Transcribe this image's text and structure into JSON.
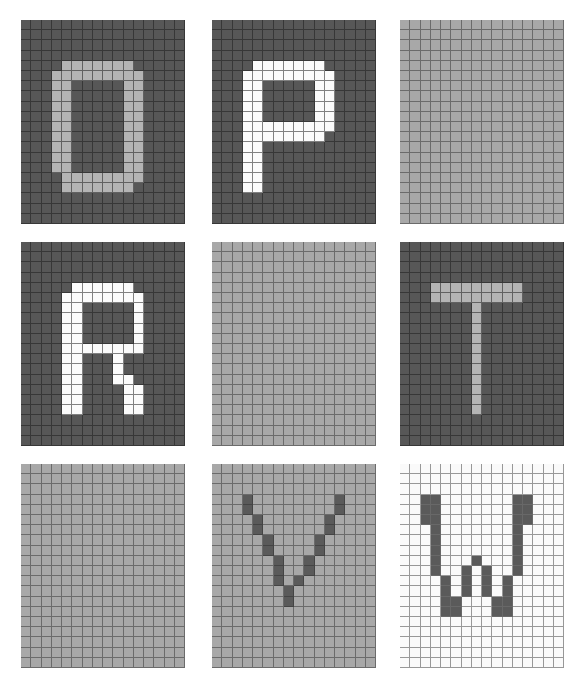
{
  "figure": {
    "type": "pixel-art-letter-grid-montage",
    "rows": 3,
    "cols": 3,
    "background_color": "#ffffff",
    "panel_grid_cols": 16,
    "panel_grid_rows": 20
  },
  "palette": {
    "dark_gray_background": "#575757",
    "light_gray_background": "#a8a8a8",
    "white_background": "#fafafa",
    "light_gray_foreground": "#b4b4b4",
    "white_foreground": "#fbfbfb",
    "dark_gray_foreground": "#5a5a5a",
    "gridline_dark": "#1e1e1e",
    "gridline_light": "#6e6e6e"
  },
  "panels": [
    {
      "index": 0,
      "position": "row1-col1",
      "letter": "O",
      "background_color": "#575757",
      "foreground_color": "#b4b4b4",
      "gridline_style": "lines-dark",
      "x": 21,
      "y": 20,
      "w": 164,
      "h": 204,
      "cols": 16,
      "rows": 20,
      "filled_cells": [
        [
          4,
          4
        ],
        [
          4,
          5
        ],
        [
          4,
          6
        ],
        [
          4,
          7
        ],
        [
          4,
          8
        ],
        [
          4,
          9
        ],
        [
          4,
          10
        ],
        [
          5,
          3
        ],
        [
          5,
          4
        ],
        [
          5,
          5
        ],
        [
          5,
          6
        ],
        [
          5,
          7
        ],
        [
          5,
          8
        ],
        [
          5,
          9
        ],
        [
          5,
          10
        ],
        [
          5,
          11
        ],
        [
          6,
          3
        ],
        [
          6,
          4
        ],
        [
          6,
          10
        ],
        [
          6,
          11
        ],
        [
          7,
          3
        ],
        [
          7,
          4
        ],
        [
          7,
          10
        ],
        [
          7,
          11
        ],
        [
          8,
          3
        ],
        [
          8,
          4
        ],
        [
          8,
          10
        ],
        [
          8,
          11
        ],
        [
          9,
          3
        ],
        [
          9,
          4
        ],
        [
          9,
          10
        ],
        [
          9,
          11
        ],
        [
          10,
          3
        ],
        [
          10,
          4
        ],
        [
          10,
          10
        ],
        [
          10,
          11
        ],
        [
          11,
          3
        ],
        [
          11,
          4
        ],
        [
          11,
          10
        ],
        [
          11,
          11
        ],
        [
          12,
          3
        ],
        [
          12,
          4
        ],
        [
          12,
          10
        ],
        [
          12,
          11
        ],
        [
          13,
          3
        ],
        [
          13,
          4
        ],
        [
          13,
          10
        ],
        [
          13,
          11
        ],
        [
          14,
          3
        ],
        [
          14,
          4
        ],
        [
          14,
          10
        ],
        [
          14,
          11
        ],
        [
          15,
          4
        ],
        [
          15,
          5
        ],
        [
          15,
          6
        ],
        [
          15,
          7
        ],
        [
          15,
          8
        ],
        [
          15,
          9
        ],
        [
          15,
          10
        ],
        [
          15,
          11
        ],
        [
          16,
          4
        ],
        [
          16,
          5
        ],
        [
          16,
          6
        ],
        [
          16,
          7
        ],
        [
          16,
          8
        ],
        [
          16,
          9
        ],
        [
          16,
          10
        ]
      ]
    },
    {
      "index": 1,
      "position": "row1-col2",
      "letter": "P",
      "background_color": "#575757",
      "foreground_color": "#fbfbfb",
      "gridline_style": "lines-dark",
      "x": 212,
      "y": 20,
      "w": 164,
      "h": 204,
      "cols": 16,
      "rows": 20,
      "filled_cells": [
        [
          4,
          4
        ],
        [
          4,
          5
        ],
        [
          4,
          6
        ],
        [
          4,
          7
        ],
        [
          4,
          8
        ],
        [
          4,
          9
        ],
        [
          4,
          10
        ],
        [
          5,
          3
        ],
        [
          5,
          4
        ],
        [
          5,
          5
        ],
        [
          5,
          6
        ],
        [
          5,
          7
        ],
        [
          5,
          8
        ],
        [
          5,
          9
        ],
        [
          5,
          10
        ],
        [
          5,
          11
        ],
        [
          6,
          3
        ],
        [
          6,
          4
        ],
        [
          6,
          10
        ],
        [
          6,
          11
        ],
        [
          7,
          3
        ],
        [
          7,
          4
        ],
        [
          7,
          10
        ],
        [
          7,
          11
        ],
        [
          8,
          3
        ],
        [
          8,
          4
        ],
        [
          8,
          10
        ],
        [
          8,
          11
        ],
        [
          9,
          3
        ],
        [
          9,
          4
        ],
        [
          9,
          10
        ],
        [
          9,
          11
        ],
        [
          10,
          3
        ],
        [
          10,
          4
        ],
        [
          10,
          5
        ],
        [
          10,
          6
        ],
        [
          10,
          7
        ],
        [
          10,
          8
        ],
        [
          10,
          9
        ],
        [
          10,
          10
        ],
        [
          10,
          11
        ],
        [
          11,
          3
        ],
        [
          11,
          4
        ],
        [
          11,
          5
        ],
        [
          11,
          6
        ],
        [
          11,
          7
        ],
        [
          11,
          8
        ],
        [
          11,
          9
        ],
        [
          11,
          10
        ],
        [
          12,
          3
        ],
        [
          12,
          4
        ],
        [
          13,
          3
        ],
        [
          13,
          4
        ],
        [
          14,
          3
        ],
        [
          14,
          4
        ],
        [
          15,
          3
        ],
        [
          15,
          4
        ],
        [
          16,
          3
        ],
        [
          16,
          4
        ]
      ]
    },
    {
      "index": 2,
      "position": "row1-col3",
      "letter": "",
      "background_color": "#a8a8a8",
      "foreground_color": "#a8a8a8",
      "gridline_style": "lines-mid",
      "x": 400,
      "y": 20,
      "w": 164,
      "h": 204,
      "cols": 16,
      "rows": 20,
      "filled_cells": []
    },
    {
      "index": 3,
      "position": "row2-col1",
      "letter": "R",
      "background_color": "#575757",
      "foreground_color": "#fbfbfb",
      "gridline_style": "lines-dark",
      "x": 21,
      "y": 242,
      "w": 164,
      "h": 204,
      "cols": 16,
      "rows": 20,
      "filled_cells": [
        [
          4,
          5
        ],
        [
          4,
          6
        ],
        [
          4,
          7
        ],
        [
          4,
          8
        ],
        [
          4,
          9
        ],
        [
          4,
          10
        ],
        [
          5,
          4
        ],
        [
          5,
          5
        ],
        [
          5,
          6
        ],
        [
          5,
          7
        ],
        [
          5,
          8
        ],
        [
          5,
          9
        ],
        [
          5,
          10
        ],
        [
          5,
          11
        ],
        [
          6,
          4
        ],
        [
          6,
          5
        ],
        [
          6,
          11
        ],
        [
          7,
          4
        ],
        [
          7,
          5
        ],
        [
          7,
          11
        ],
        [
          8,
          4
        ],
        [
          8,
          5
        ],
        [
          8,
          11
        ],
        [
          9,
          4
        ],
        [
          9,
          5
        ],
        [
          9,
          11
        ],
        [
          10,
          4
        ],
        [
          10,
          5
        ],
        [
          10,
          6
        ],
        [
          10,
          7
        ],
        [
          10,
          8
        ],
        [
          10,
          9
        ],
        [
          10,
          10
        ],
        [
          10,
          11
        ],
        [
          11,
          4
        ],
        [
          11,
          5
        ],
        [
          11,
          9
        ],
        [
          12,
          4
        ],
        [
          12,
          5
        ],
        [
          12,
          9
        ],
        [
          13,
          4
        ],
        [
          13,
          5
        ],
        [
          13,
          9
        ],
        [
          13,
          10
        ],
        [
          14,
          4
        ],
        [
          14,
          5
        ],
        [
          14,
          10
        ],
        [
          14,
          11
        ],
        [
          15,
          4
        ],
        [
          15,
          5
        ],
        [
          15,
          10
        ],
        [
          15,
          11
        ],
        [
          16,
          4
        ],
        [
          16,
          5
        ],
        [
          16,
          10
        ],
        [
          16,
          11
        ]
      ]
    },
    {
      "index": 4,
      "position": "row2-col2",
      "letter": "",
      "background_color": "#a8a8a8",
      "foreground_color": "#a8a8a8",
      "gridline_style": "lines-mid",
      "x": 212,
      "y": 242,
      "w": 164,
      "h": 204,
      "cols": 16,
      "rows": 20,
      "filled_cells": []
    },
    {
      "index": 5,
      "position": "row2-col3",
      "letter": "T",
      "background_color": "#575757",
      "foreground_color": "#b4b4b4",
      "gridline_style": "lines-dark",
      "x": 400,
      "y": 242,
      "w": 164,
      "h": 204,
      "cols": 16,
      "rows": 20,
      "filled_cells": [
        [
          4,
          3
        ],
        [
          4,
          4
        ],
        [
          4,
          5
        ],
        [
          4,
          6
        ],
        [
          4,
          7
        ],
        [
          4,
          8
        ],
        [
          4,
          9
        ],
        [
          4,
          10
        ],
        [
          4,
          11
        ],
        [
          5,
          3
        ],
        [
          5,
          4
        ],
        [
          5,
          5
        ],
        [
          5,
          6
        ],
        [
          5,
          7
        ],
        [
          5,
          8
        ],
        [
          5,
          9
        ],
        [
          5,
          10
        ],
        [
          5,
          11
        ],
        [
          6,
          7
        ],
        [
          7,
          7
        ],
        [
          8,
          7
        ],
        [
          9,
          7
        ],
        [
          10,
          7
        ],
        [
          11,
          7
        ],
        [
          12,
          7
        ],
        [
          13,
          7
        ],
        [
          14,
          7
        ],
        [
          15,
          7
        ],
        [
          16,
          7
        ]
      ]
    },
    {
      "index": 6,
      "position": "row3-col1",
      "letter": "",
      "background_color": "#a8a8a8",
      "foreground_color": "#a8a8a8",
      "gridline_style": "lines-mid",
      "x": 21,
      "y": 464,
      "w": 164,
      "h": 204,
      "cols": 16,
      "rows": 20,
      "filled_cells": []
    },
    {
      "index": 7,
      "position": "row3-col2",
      "letter": "V",
      "background_color": "#a8a8a8",
      "foreground_color": "#5a5a5a",
      "gridline_style": "lines-mid",
      "x": 212,
      "y": 464,
      "w": 164,
      "h": 204,
      "cols": 16,
      "rows": 20,
      "filled_cells": [
        [
          3,
          3
        ],
        [
          3,
          12
        ],
        [
          4,
          3
        ],
        [
          4,
          12
        ],
        [
          5,
          4
        ],
        [
          5,
          11
        ],
        [
          6,
          4
        ],
        [
          6,
          11
        ],
        [
          7,
          5
        ],
        [
          7,
          10
        ],
        [
          8,
          5
        ],
        [
          8,
          10
        ],
        [
          9,
          6
        ],
        [
          9,
          9
        ],
        [
          10,
          6
        ],
        [
          10,
          9
        ],
        [
          11,
          6
        ],
        [
          11,
          8
        ],
        [
          12,
          7
        ],
        [
          13,
          7
        ]
      ]
    },
    {
      "index": 8,
      "position": "row3-col3",
      "letter": "W",
      "background_color": "#fafafa",
      "foreground_color": "#5a5a5a",
      "gridline_style": "lines-light",
      "x": 400,
      "y": 464,
      "w": 164,
      "h": 204,
      "cols": 16,
      "rows": 20,
      "filled_cells": [
        [
          3,
          2
        ],
        [
          3,
          3
        ],
        [
          3,
          11
        ],
        [
          3,
          12
        ],
        [
          4,
          2
        ],
        [
          4,
          3
        ],
        [
          4,
          11
        ],
        [
          4,
          12
        ],
        [
          5,
          2
        ],
        [
          5,
          3
        ],
        [
          5,
          11
        ],
        [
          5,
          12
        ],
        [
          6,
          3
        ],
        [
          6,
          11
        ],
        [
          7,
          3
        ],
        [
          7,
          11
        ],
        [
          8,
          3
        ],
        [
          8,
          11
        ],
        [
          9,
          3
        ],
        [
          9,
          7
        ],
        [
          9,
          11
        ],
        [
          10,
          3
        ],
        [
          10,
          6
        ],
        [
          10,
          8
        ],
        [
          10,
          11
        ],
        [
          11,
          4
        ],
        [
          11,
          6
        ],
        [
          11,
          8
        ],
        [
          11,
          10
        ],
        [
          12,
          4
        ],
        [
          12,
          6
        ],
        [
          12,
          8
        ],
        [
          12,
          10
        ],
        [
          13,
          4
        ],
        [
          13,
          5
        ],
        [
          13,
          9
        ],
        [
          13,
          10
        ],
        [
          14,
          4
        ],
        [
          14,
          5
        ],
        [
          14,
          9
        ],
        [
          14,
          10
        ]
      ]
    }
  ]
}
